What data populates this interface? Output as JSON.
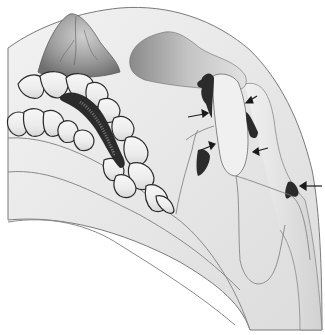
{
  "diagram": {
    "type": "anatomical-illustration",
    "arrow_count": 6,
    "arrows": [
      {
        "id": "arrow-1",
        "x1": 188,
        "y1": 117,
        "x2": 206,
        "y2": 114
      },
      {
        "id": "arrow-2",
        "x1": 256,
        "y1": 96,
        "x2": 246,
        "y2": 102
      },
      {
        "id": "arrow-3",
        "x1": 201,
        "y1": 150,
        "x2": 214,
        "y2": 145
      },
      {
        "id": "arrow-4",
        "x1": 268,
        "y1": 148,
        "x2": 254,
        "y2": 152
      },
      {
        "id": "arrow-5",
        "x1": 322,
        "y1": 186,
        "x2": 301,
        "y2": 186
      }
    ],
    "colors": {
      "outline": "#7a7a7a",
      "tooth_outline": "#2a2a2a",
      "lesion": "#2b2b2b",
      "tissue_light": "#ececec",
      "tissue_mid": "#d6d6d6",
      "tissue_dark": "#8c8c8c",
      "background": "#ffffff"
    }
  }
}
